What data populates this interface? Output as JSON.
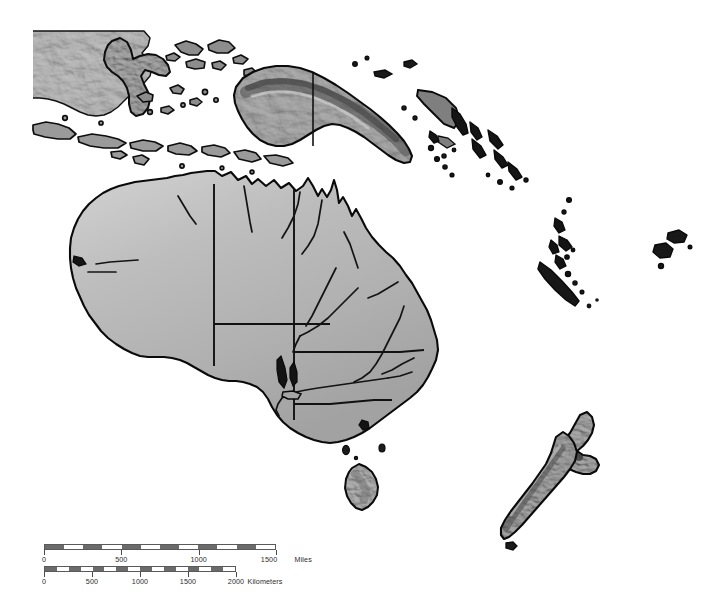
{
  "map": {
    "title": "Oceania Shaded Relief Map",
    "region": "Australia, New Zealand, New Guinea and the Southwest Pacific",
    "background_color": "#ffffff",
    "land_fill_color": "#b4b4b4",
    "land_highlight_color": "#d8d8d8",
    "land_shadow_color": "#6e6e6e",
    "coastline_color": "#0a0a0a",
    "border_color": "#111111",
    "river_color": "#1a1a1a",
    "style": "grayscale-shaded-relief",
    "features": {
      "landmasses": [
        "Australia",
        "Tasmania",
        "New Zealand North Island",
        "New Zealand South Island",
        "New Guinea",
        "Borneo",
        "Sulawesi",
        "Lesser Sunda Islands",
        "Solomon Islands",
        "Vanuatu",
        "New Caledonia",
        "Fiji",
        "New Britain",
        "Kangaroo Island"
      ],
      "internal_borders": [
        "Western Australia / Northern Territory",
        "Northern Territory / Queensland",
        "Western Australia / South Australia",
        "South Australia / Northern Territory",
        "South Australia / Queensland",
        "South Australia / New South Wales",
        "Queensland / New South Wales",
        "New South Wales / Victoria",
        "Indonesia / Papua New Guinea"
      ],
      "rivers": [
        "Murray River",
        "Darling River",
        "Murrumbidgee River",
        "Cooper Creek",
        "Diamantina River",
        "Flinders River",
        "Victoria River",
        "Fitzroy River",
        "Gascoyne River",
        "Lachlan River"
      ]
    }
  },
  "scale_bars": [
    {
      "id": "miles",
      "unit_label": "Miles",
      "max_value": 1500,
      "tick_labels": [
        "0",
        "500",
        "1000",
        "1500"
      ],
      "tick_values": [
        0,
        500,
        1000,
        1500
      ],
      "segment_count": 12,
      "bar_color": "#6b6b6b",
      "outline_color": "#5a5a5a"
    },
    {
      "id": "kilometers",
      "unit_label": "Kilometers",
      "max_value": 2000,
      "tick_labels": [
        "0",
        "500",
        "1000",
        "1500",
        "2000"
      ],
      "tick_values": [
        0,
        500,
        1000,
        1500,
        2000
      ],
      "segment_count": 16,
      "bar_color": "#6b6b6b",
      "outline_color": "#5a5a5a"
    }
  ]
}
